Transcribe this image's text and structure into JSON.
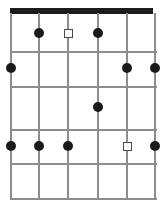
{
  "diagram": {
    "kind": "guitar-fretboard-chord-diagram",
    "title": "",
    "width": 160,
    "height": 206,
    "colors": {
      "background": "#ffffff",
      "nut": "#1c1c1c",
      "grid_line": "#8d8d8d",
      "dot_fill": "#1a1a1a",
      "square_stroke": "#4a4a4a",
      "square_fill": "#ffffff"
    },
    "nut": {
      "x": 10,
      "y": 8,
      "width": 143,
      "height": 6
    },
    "strings": [
      {
        "index": 1,
        "x": 11,
        "top": 13,
        "bottom": 200
      },
      {
        "index": 2,
        "x": 39,
        "top": 13,
        "bottom": 200
      },
      {
        "index": 3,
        "x": 68,
        "top": 13,
        "bottom": 200
      },
      {
        "index": 4,
        "x": 98,
        "top": 13,
        "bottom": 200
      },
      {
        "index": 5,
        "x": 127,
        "top": 13,
        "bottom": 200
      },
      {
        "index": 6,
        "x": 155,
        "top": 13,
        "bottom": 200
      }
    ],
    "frets": [
      {
        "index": 1,
        "y": 51,
        "left": 11,
        "right": 156
      },
      {
        "index": 2,
        "y": 86,
        "left": 11,
        "right": 156
      },
      {
        "index": 3,
        "y": 129,
        "left": 11,
        "right": 156
      },
      {
        "index": 4,
        "y": 163,
        "left": 11,
        "right": 156
      },
      {
        "index": 5,
        "y": 198,
        "left": 11,
        "right": 156
      }
    ],
    "markers": [
      {
        "id": "m1",
        "shape": "dot",
        "string": 2,
        "fret": 1,
        "x": 39,
        "y": 33
      },
      {
        "id": "m2",
        "shape": "square",
        "string": 3,
        "fret": 1,
        "x": 68,
        "y": 33
      },
      {
        "id": "m3",
        "shape": "dot",
        "string": 4,
        "fret": 1,
        "x": 98,
        "y": 33
      },
      {
        "id": "m4",
        "shape": "dot",
        "string": 1,
        "fret": 2,
        "x": 11,
        "y": 68
      },
      {
        "id": "m5",
        "shape": "dot",
        "string": 5,
        "fret": 2,
        "x": 127,
        "y": 68
      },
      {
        "id": "m6",
        "shape": "dot",
        "string": 6,
        "fret": 2,
        "x": 155,
        "y": 68
      },
      {
        "id": "m7",
        "shape": "dot",
        "string": 4,
        "fret": 3,
        "x": 98,
        "y": 107
      },
      {
        "id": "m8",
        "shape": "dot",
        "string": 1,
        "fret": 4,
        "x": 11,
        "y": 146
      },
      {
        "id": "m9",
        "shape": "dot",
        "string": 2,
        "fret": 4,
        "x": 39,
        "y": 146
      },
      {
        "id": "m10",
        "shape": "dot",
        "string": 3,
        "fret": 4,
        "x": 68,
        "y": 146
      },
      {
        "id": "m11",
        "shape": "square",
        "string": 5,
        "fret": 4,
        "x": 127,
        "y": 146
      },
      {
        "id": "m12",
        "shape": "dot",
        "string": 6,
        "fret": 4,
        "x": 155,
        "y": 146
      }
    ]
  }
}
